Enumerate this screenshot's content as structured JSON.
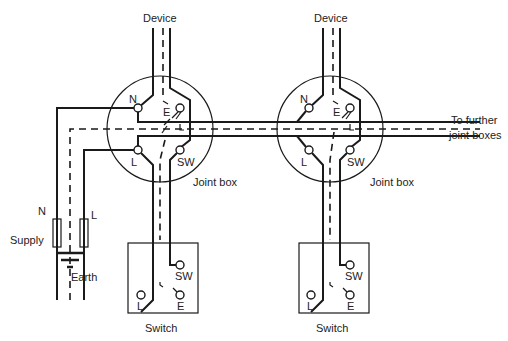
{
  "diagram": {
    "type": "electrical-wiring",
    "labels": {
      "device_1": "Device",
      "device_2": "Device",
      "joint_box_1": "Joint box",
      "joint_box_2": "Joint box",
      "switch_1": "Switch",
      "switch_2": "Switch",
      "further": "To further",
      "further_2": "joint boxes",
      "supply": "Supply",
      "earth": "Earth",
      "supply_n": "N",
      "supply_l": "L"
    },
    "joint_box_terminals": [
      "N",
      "E",
      "L",
      "SW"
    ],
    "switch_terminals": [
      "SW",
      "L",
      "E"
    ],
    "colors": {
      "line": "#1a1a1a",
      "background": "#ffffff"
    }
  }
}
